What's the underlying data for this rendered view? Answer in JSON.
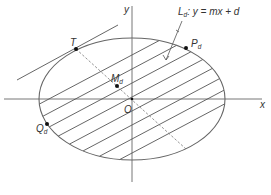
{
  "figure": {
    "axes": {
      "x_label": "x",
      "y_label": "y",
      "origin_label": "O"
    },
    "line_label": {
      "main": "L",
      "sub": "d",
      "equation": ": y = mx + d"
    },
    "points": [
      {
        "id": "T",
        "main": "T",
        "sub": "",
        "x": 76,
        "y": 49
      },
      {
        "id": "Md",
        "main": "M",
        "sub": "d",
        "x": 117,
        "y": 86
      },
      {
        "id": "Pd",
        "main": "P",
        "sub": "d",
        "x": 186,
        "y": 48
      },
      {
        "id": "Qd",
        "main": "Q",
        "sub": "d",
        "x": 47,
        "y": 124
      },
      {
        "id": "O",
        "main": "O",
        "sub": "",
        "x": 132,
        "y": 99
      }
    ],
    "ellipse": {
      "cx": 132,
      "cy": 99,
      "rx": 93,
      "ry": 61
    },
    "chord_slope": -0.53,
    "chord_offsets": [
      -44,
      -30,
      -16,
      -2,
      12,
      26,
      40,
      54
    ],
    "tangent": {
      "x1": 17,
      "y1": 80,
      "x2": 118,
      "y2": 25
    },
    "diameter": {
      "x1": 76,
      "y1": 49,
      "x2": 186,
      "y2": 149
    },
    "colors": {
      "line": "#555555",
      "axis": "#777777",
      "point": "#111111"
    }
  }
}
